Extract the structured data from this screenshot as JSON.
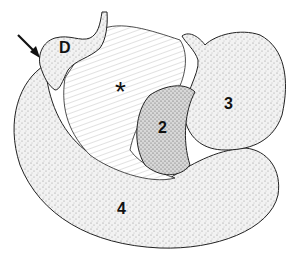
{
  "figure": {
    "type": "anatomical-illustration",
    "labels": {
      "d": "D",
      "asterisk": "*",
      "two": "2",
      "three": "3",
      "four": "4"
    },
    "arrow": {
      "direction": "down-right",
      "points_to": "D"
    },
    "colors": {
      "outline": "#222222",
      "stipple": "#666666",
      "background": "#ffffff"
    }
  }
}
